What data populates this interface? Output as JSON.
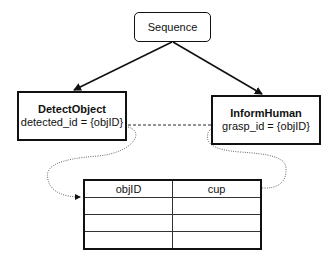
{
  "diagram": {
    "root": {
      "label": "Sequence"
    },
    "children": [
      {
        "title": "DetectObject",
        "port": "detected_id = {objID}"
      },
      {
        "title": "InformHuman",
        "port": "grasp_id = {objID}"
      }
    ],
    "blackboard": {
      "rows": [
        [
          "objID",
          "cup"
        ],
        [
          "",
          ""
        ],
        [
          "",
          ""
        ],
        [
          "",
          ""
        ]
      ]
    },
    "edges": [
      {
        "from": "Sequence",
        "to": "DetectObject",
        "style": "solid"
      },
      {
        "from": "Sequence",
        "to": "InformHuman",
        "style": "solid"
      },
      {
        "from": "DetectObject.detected_id",
        "to": "InformHuman.grasp_id",
        "style": "dashed"
      },
      {
        "from": "DetectObject.detected_id",
        "to": "blackboard.objID",
        "style": "dotted"
      },
      {
        "from": "blackboard.cup",
        "to": "InformHuman.grasp_id",
        "style": "dotted"
      }
    ],
    "colors": {
      "stroke": "#111111",
      "dotted": "#555555",
      "background": "#ffffff"
    }
  }
}
